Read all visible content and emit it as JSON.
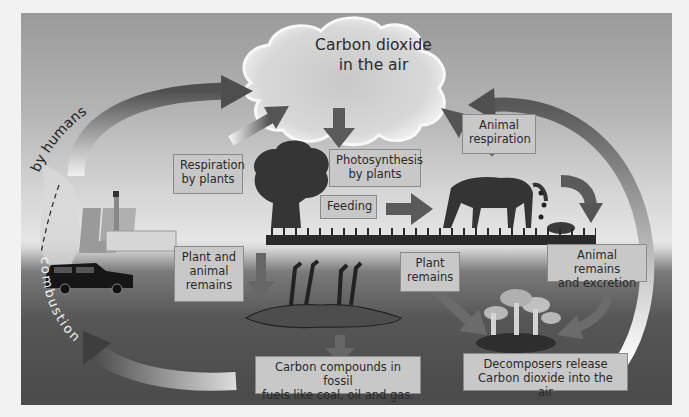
{
  "diagram": {
    "cloud": {
      "label": "Carbon dioxide\nin the air"
    },
    "labels": {
      "respiration_by_plants": "Respiration\nby plants",
      "photosynthesis": "Photosynthesis\nby plants",
      "animal_respiration": "Animal\nrespiration",
      "feeding": "Feeding",
      "plant_and_animal_remains": "Plant and\nanimal\nremains",
      "plant_remains": "Plant\nremains",
      "animal_remains_excretion": "Animal remains\nand excretion",
      "fossil_fuels": "Carbon compounds in fossil\nfuels like coal, oil and gas.",
      "decomposers": "Decomposers release\nCarbon dioxide into the air",
      "by_humans": "by humans",
      "combustion": "combustion"
    },
    "elements": [
      "cloud",
      "tree",
      "horse",
      "dead-horse",
      "mushrooms",
      "power-plant",
      "car"
    ],
    "colors": {
      "sky_top": "#9a9a9a",
      "ground": "#4a4a4a",
      "arrow": "#5a5a5a",
      "label_bg": "#c8c8c8"
    }
  }
}
